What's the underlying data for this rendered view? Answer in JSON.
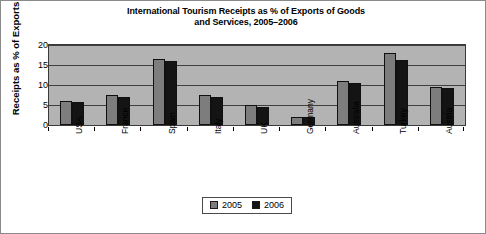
{
  "chart_data": {
    "type": "bar",
    "title": "International Tourism Receipts as % of Exports of Goods and Services, 2005–2006",
    "title_line1": "International Tourism Receipts as % of Exports of Goods",
    "title_line2": "and Services, 2005–2006",
    "xlabel": "",
    "ylabel": "Receipts as % of Exports",
    "ylim": [
      0,
      20
    ],
    "yticks": [
      0,
      5,
      10,
      15,
      20
    ],
    "ytick_labels": [
      "0",
      "5",
      "10",
      "15",
      "20"
    ],
    "grid": true,
    "legend_position": "bottom-center",
    "categories": [
      "USA",
      "France",
      "Spain",
      "Italy",
      "UK",
      "Germany",
      "Australia",
      "Turkey",
      "Austria"
    ],
    "series": [
      {
        "name": "2005",
        "color": "#7d7d7d",
        "values": [
          6.1,
          7.6,
          16.5,
          7.5,
          5.0,
          2.0,
          11.0,
          17.9,
          9.5
        ]
      },
      {
        "name": "2006",
        "color": "#141414",
        "values": [
          5.8,
          7.1,
          15.9,
          7.1,
          4.6,
          1.9,
          10.6,
          16.3,
          9.2
        ]
      }
    ]
  },
  "legend": {
    "entries": [
      {
        "label": "2005",
        "color": "#7d7d7d"
      },
      {
        "label": "2006",
        "color": "#141414"
      }
    ]
  }
}
